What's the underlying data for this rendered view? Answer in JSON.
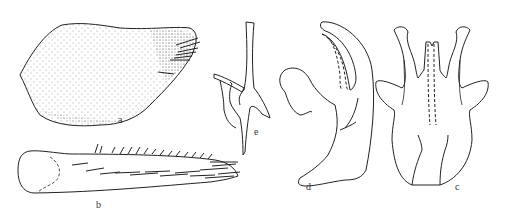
{
  "figure": {
    "panels": [
      {
        "id": "a",
        "label": "a",
        "description": "stippled sclerite with setae at apex"
      },
      {
        "id": "b",
        "label": "b",
        "description": "elongate segment with row of spines and setae"
      },
      {
        "id": "e",
        "label": "e",
        "description": "narrow process, lateral view"
      },
      {
        "id": "d",
        "label": "d",
        "description": "curved structure, lateral view"
      },
      {
        "id": "c",
        "label": "c",
        "description": "genital capsule, ventral view"
      }
    ],
    "colors": {
      "line": "#222222",
      "background": "#ffffff"
    }
  }
}
